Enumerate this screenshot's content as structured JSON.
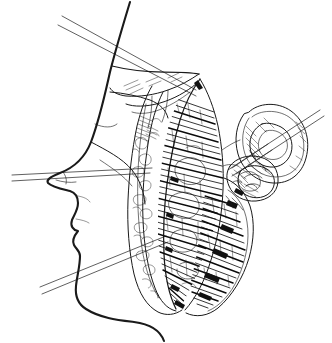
{
  "figure": {
    "title": "Lateral head profile with lateral facial (parotid–masseteric) dissection",
    "domain": "medical line illustration",
    "caption": "",
    "background_color": "#ffffff",
    "ink_color": "#1a1a1a",
    "canvas": {
      "width": 332,
      "height": 343
    },
    "style": "black-and-white pen-and-ink hatched engraving",
    "labels": [],
    "annotations": [],
    "parts": [
      {
        "name": "head-profile",
        "label": "Head profile in lateral view"
      },
      {
        "name": "forehead-contour",
        "label": "Forehead and glabella contour"
      },
      {
        "name": "nose-profile",
        "label": "Nasal dorsum and tip"
      },
      {
        "name": "lips-profile",
        "label": "Upper and lower lip"
      },
      {
        "name": "chin-profile",
        "label": "Mentum and submental contour"
      },
      {
        "name": "neck-contour",
        "label": "Anterior neck"
      },
      {
        "name": "ear-auricle",
        "label": "Auricle (external ear)"
      },
      {
        "name": "ear-helix",
        "label": "Helix"
      },
      {
        "name": "ear-antihelix",
        "label": "Antihelix and concha"
      },
      {
        "name": "ear-lobule",
        "label": "Lobule"
      },
      {
        "name": "skin-flap",
        "label": "Elevated skin and SMAS flap"
      },
      {
        "name": "flap-margin",
        "label": "Cut flap margin"
      },
      {
        "name": "masseter-muscle",
        "label": "Masseter muscle with striated fibres"
      },
      {
        "name": "parotid-gland",
        "label": "Parotid gland region"
      },
      {
        "name": "zygomatic-region",
        "label": "Zygomatic arch region"
      },
      {
        "name": "mandible-border",
        "label": "Inferior border of mandible"
      },
      {
        "name": "reference-line-upper",
        "label": "Upper reference / incision guide line"
      },
      {
        "name": "reference-line-lower",
        "label": "Lower reference / incision guide line"
      },
      {
        "name": "reference-line-ear",
        "label": "Reference line through auricle"
      }
    ]
  }
}
